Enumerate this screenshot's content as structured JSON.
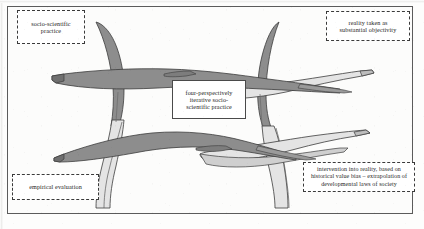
{
  "figure": {
    "kind": "conceptual-3d-surface-diagram",
    "frame_border_color": "#5b5b5b",
    "paper_color": "#fdfdfc"
  },
  "labels": {
    "top_left": {
      "name": "socio-scientific-practice-label",
      "line1": "socio-scientific",
      "line2": "practice",
      "border_style": "dashed"
    },
    "top_right": {
      "name": "reality-objectivity-label",
      "line1": "reality taken as",
      "line2": "substantial objectivity",
      "border_style": "dashed"
    },
    "center": {
      "name": "four-perspectively-iterative-label",
      "line1": "four-perspectively",
      "line2": "iterative socio-",
      "line3": "scientific practice",
      "border_style": "solid"
    },
    "bottom_right": {
      "name": "intervention-into-reality-label",
      "line1": "intervention into reality, based on",
      "line2": "historical value bias – extrapolation of",
      "line3": "developmental laws of society",
      "border_style": "dashed"
    },
    "bottom_left": {
      "name": "empirical-evaluation-label",
      "line1": "empirical evaluation",
      "border_style": "dashed"
    }
  },
  "surface": {
    "dark_fill": "#8d8d8d",
    "mid_fill": "#b9b9b9",
    "light_fill": "#dedede",
    "pale_fill": "#e9e9e9",
    "outline": "#3c3c3c"
  }
}
